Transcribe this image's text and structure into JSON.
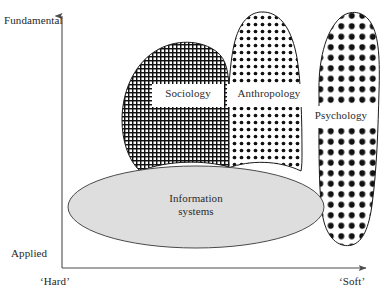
{
  "figure": {
    "axes": {
      "y_top_label": "Fundamental",
      "y_bottom_label": "Applied",
      "x_left_label": "‘Hard’",
      "x_right_label": "‘Soft’"
    },
    "regions": [
      {
        "id": "sociology",
        "label": "Sociology",
        "fill": "grid",
        "stroke": "#1a1a1a"
      },
      {
        "id": "anthropology",
        "label": "Anthropology",
        "fill": "small-dots",
        "stroke": "#1a1a1a"
      },
      {
        "id": "psychology",
        "label": "Psychology",
        "fill": "large-dots",
        "stroke": "#1a1a1a"
      },
      {
        "id": "information-systems",
        "label": "Information\nsystems",
        "label_line1": "Information",
        "label_line2": "systems",
        "fill": "#dedede",
        "stroke": "#4a4a4a"
      }
    ],
    "colors": {
      "background": "#ffffff",
      "ink": "#1a1a1a",
      "axis": "#4d4d4d",
      "ellipse_fill": "#dedede",
      "ellipse_stroke": "#4a4a4a",
      "label_text": "#2b2b2b"
    }
  }
}
